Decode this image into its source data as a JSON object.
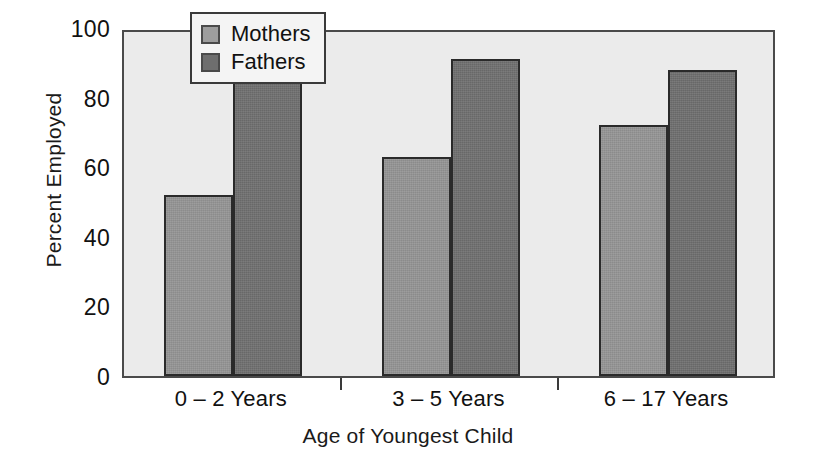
{
  "chart_data": {
    "type": "bar",
    "title": "",
    "subtitle": "",
    "xlabel": "Age of Youngest Child",
    "ylabel": "Percent Employed",
    "categories": [
      "0 – 2 Years",
      "3 – 5 Years",
      "6 – 17 Years"
    ],
    "series": [
      {
        "name": "Mothers",
        "values": [
          52,
          63,
          72
        ],
        "color": "#949494"
      },
      {
        "name": "Fathers",
        "values": [
          91,
          91,
          88
        ],
        "color": "#6e6e6e"
      }
    ],
    "ylim": [
      0,
      100
    ],
    "y_ticks": [
      0,
      20,
      40,
      60,
      80,
      100
    ],
    "y_tick_labels": [
      "0",
      "20",
      "40",
      "60",
      "80",
      "100"
    ],
    "grid": false,
    "legend_position": "top-center-left",
    "plot_background": "#ebebeb",
    "axis_color": "#4a4a4a"
  },
  "legend": {
    "items": [
      {
        "label": "Mothers",
        "swatch": "mothers"
      },
      {
        "label": "Fathers",
        "swatch": "fathers"
      }
    ]
  },
  "axes": {
    "y_title": "Percent Employed",
    "x_title": "Age of Youngest Child"
  }
}
